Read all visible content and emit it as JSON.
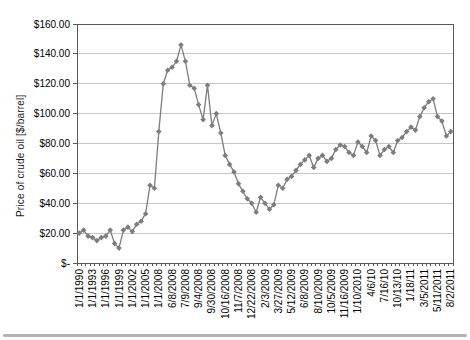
{
  "page": {
    "background": "#ffffff",
    "divider_color": "#b3b3b3"
  },
  "chart_data": {
    "type": "line",
    "title": "",
    "xlabel": "",
    "ylabel": "Price of crude oil [$/barrel]",
    "ylim": [
      0,
      160
    ],
    "y_ticks": [
      0,
      20,
      40,
      60,
      80,
      100,
      120,
      140,
      160
    ],
    "y_tick_labels": [
      "$-",
      "$20.00",
      "$40.00",
      "$60.00",
      "$80.00",
      "$100.00",
      "$120.00",
      "$140.00",
      "$160.00"
    ],
    "x_tick_labels": [
      "1/1/1990",
      "1/1/1993",
      "1/1/1996",
      "1/1/1999",
      "1/1/2002",
      "1/1/2005",
      "1/1/2008",
      "6/8/2008",
      "7/9/2008",
      "9/4/2008",
      "9/30/2008",
      "10/16/2008",
      "11/7/2008",
      "12/22/2008",
      "2/3/2009",
      "3/27/2009",
      "5/12/2009",
      "6/8/2009",
      "8/10/2009",
      "10/5/2009",
      "11/16/2009",
      "1/10/2010",
      "4/6/10",
      "7/16/10",
      "10/13/10",
      "1/18/11",
      "3/5/2011",
      "5/11/2011",
      "8/2/2011"
    ],
    "label_every_n_points": 3,
    "grid": "horizontal",
    "legend": "none",
    "marker": "diamond",
    "colors": {
      "series": "#7d7d7d",
      "gridline": "#c6c6c6",
      "axis": "#595959",
      "text": "#000000"
    },
    "series": [
      {
        "name": "Price of crude oil [$/barrel]",
        "values": [
          20,
          22,
          18,
          17,
          15,
          17,
          18,
          22,
          13,
          10,
          22,
          24,
          21,
          26,
          28,
          33,
          52,
          50,
          88,
          120,
          129,
          131,
          135,
          146,
          135,
          119,
          117,
          106,
          96,
          119,
          92,
          100,
          87,
          72,
          66,
          61,
          53,
          48,
          43,
          40,
          34,
          44,
          40,
          36,
          39,
          52,
          50,
          56,
          58,
          62,
          66,
          69,
          72,
          64,
          70,
          72,
          68,
          70,
          76,
          79,
          78,
          74,
          72,
          81,
          78,
          74,
          85,
          82,
          72,
          76,
          78,
          74,
          82,
          84,
          88,
          91,
          89,
          98,
          104,
          108,
          110,
          98,
          95,
          85,
          88
        ]
      }
    ]
  }
}
